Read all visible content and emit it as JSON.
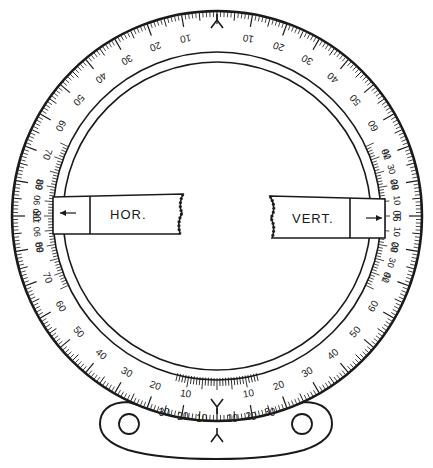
{
  "diagram": {
    "center": [
      217,
      216
    ],
    "outer_radius": 205,
    "scale_inner_radius": 164,
    "ring_radius": 154,
    "ink": "#1a1a1a",
    "paper": "#ffffff"
  },
  "outer_scale": {
    "index_mark_top": "Y",
    "labels_right": [
      "10",
      "20",
      "30",
      "40",
      "50",
      "60",
      "70",
      "80",
      "90"
    ],
    "labels_left": [
      "10",
      "20",
      "30",
      "40",
      "50",
      "60",
      "70",
      "80",
      "90"
    ],
    "lower_labels_left": [
      "90",
      "80",
      "70",
      "60",
      "50",
      "40",
      "30",
      "20",
      "10"
    ],
    "lower_labels_right": [
      "90",
      "80",
      "70",
      "60",
      "50",
      "40",
      "30",
      "20",
      "10"
    ]
  },
  "inner_scale": {
    "left_labels": [
      "80",
      "90",
      "100",
      "90",
      "80"
    ],
    "right_labels": [
      "40",
      "30",
      "20",
      "10",
      "0",
      "10",
      "20",
      "30",
      "40"
    ]
  },
  "arms": {
    "horizontal": {
      "label": "HOR.",
      "pointer": "←"
    },
    "vertical": {
      "label": "VERT.",
      "pointer": "→"
    }
  },
  "bottom_vernier": {
    "index_mark": "Y",
    "labels": [
      "30",
      "20",
      "10",
      "10",
      "20",
      "30"
    ]
  }
}
